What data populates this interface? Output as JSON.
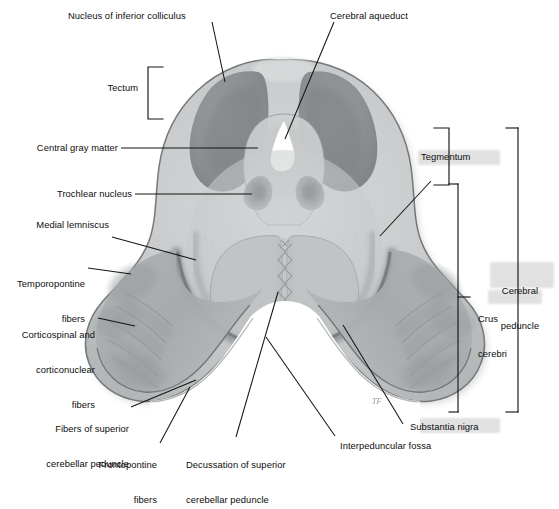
{
  "figure": {
    "type": "anatomical-cross-section",
    "background": "#ffffff",
    "palette": {
      "outline": "#6e7173",
      "parenchyma_light": "#cfd1d2",
      "parenchyma_mid": "#bcbfc0",
      "tegmentum": "#c6c8c9",
      "colliculus_dark": "#8b8e90",
      "crus_cerebri": "#a9acad",
      "substantia_nigra": "#8e9193",
      "aqueduct_white": "#ffffff",
      "leader_line": "#1a1a1a",
      "highlight_shadow": "#c9c9c9"
    }
  },
  "labels": {
    "nucleus_of_inferior_colliculus": "Nucleus of inferior colliculus",
    "cerebral_aqueduct": "Cerebral aqueduct",
    "tectum": "Tectum",
    "central_gray_matter": "Central gray matter",
    "trochlear_nucleus": "Trochlear nucleus",
    "medial_lemniscus": "Medial lemniscus",
    "temporopontine_fibers_l1": "Temporopontine",
    "temporopontine_fibers_l2": "fibers",
    "corticospinal_l1": "Corticospinal and",
    "corticospinal_l2": "corticonuclear",
    "corticospinal_l3": "fibers",
    "fibers_superior_cp_l1": "Fibers of superior",
    "fibers_superior_cp_l2": "cerebellar peduncle",
    "frontopontine_l1": "Frontopontine",
    "frontopontine_l2": "fibers",
    "decussation_l1": "Decussation of superior",
    "decussation_l2": "cerebellar peduncle",
    "interpeduncular_fossa": "Interpeduncular fossa",
    "substantia_nigra": "Substantia nigra",
    "crus_cerebri_l1": "Crus",
    "crus_cerebri_l2": "cerebri",
    "cerebral_peduncle_l1": "Cerebral",
    "cerebral_peduncle_l2": "peduncle",
    "tegmentum": "Tegmentum"
  },
  "structures": [
    {
      "name": "Nucleus of inferior colliculus",
      "side": "bilateral",
      "shade": "dark-gray",
      "region": "tectum"
    },
    {
      "name": "Cerebral aqueduct",
      "side": "midline",
      "shade": "white",
      "region": "tegmentum"
    },
    {
      "name": "Central gray matter",
      "side": "midline",
      "shade": "light-gray",
      "region": "periaqueductal"
    },
    {
      "name": "Trochlear nucleus",
      "side": "bilateral",
      "shade": "dark-gray",
      "region": "tegmentum"
    },
    {
      "name": "Medial lemniscus",
      "side": "bilateral",
      "shade": "mid-gray",
      "region": "tegmentum"
    },
    {
      "name": "Temporopontine fibers",
      "side": "bilateral",
      "shade": "mid-gray",
      "region": "crus-cerebri"
    },
    {
      "name": "Corticospinal and corticonuclear fibers",
      "side": "bilateral",
      "shade": "mid-gray",
      "region": "crus-cerebri"
    },
    {
      "name": "Frontopontine fibers",
      "side": "bilateral",
      "shade": "mid-gray",
      "region": "crus-cerebri"
    },
    {
      "name": "Fibers of superior cerebellar peduncle",
      "side": "bilateral",
      "shade": "light-gray",
      "region": "tegmentum"
    },
    {
      "name": "Decussation of superior cerebellar peduncle",
      "side": "midline",
      "shade": "hatched",
      "region": "tegmentum"
    },
    {
      "name": "Interpeduncular fossa",
      "side": "midline",
      "shade": "white",
      "region": "ventral"
    },
    {
      "name": "Substantia nigra",
      "side": "bilateral",
      "shade": "dark-band",
      "region": "between-tegmentum-and-crus"
    }
  ],
  "brackets": [
    {
      "name": "tectum",
      "orientation": "right-facing",
      "spans": "dorsal tectum"
    },
    {
      "name": "tegmentum",
      "orientation": "left-facing",
      "spans": "tegmentum"
    },
    {
      "name": "crus-cerebri",
      "orientation": "left-facing",
      "spans": "crus cerebri"
    },
    {
      "name": "cerebral-peduncle",
      "orientation": "left-facing",
      "spans": "tegmentum + crus cerebri"
    }
  ],
  "signature": "TF"
}
